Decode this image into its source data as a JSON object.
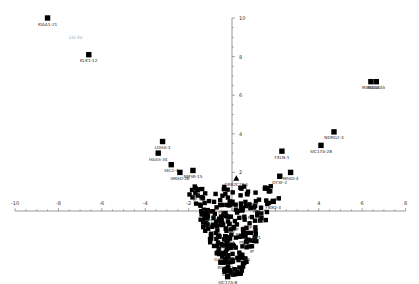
{
  "chart_data": {
    "type": "scatter",
    "title": "",
    "xlabel": "",
    "ylabel": "",
    "xlim": [
      -10,
      8
    ],
    "ylim": [
      -3.8,
      10
    ],
    "x_ticks": [
      -10,
      -8,
      -6,
      -4,
      -2,
      4,
      6,
      8
    ],
    "y_ticks": [
      2,
      4,
      6,
      8,
      10
    ],
    "grid": false,
    "legend": null,
    "annotation": {
      "text": "Lin Fo",
      "x": -7.5,
      "y": 8.9
    },
    "labeled_points": [
      {
        "label": "KIAA1-21",
        "x": -8.5,
        "y": 10.0,
        "marker": "square"
      },
      {
        "label": "KLK1-12",
        "x": -6.6,
        "y": 8.1,
        "marker": "square"
      },
      {
        "label": "LDHA-3",
        "x": -3.2,
        "y": 3.6,
        "marker": "square"
      },
      {
        "label": "HAAS-34",
        "x": -3.4,
        "y": 3.0,
        "marker": "square"
      },
      {
        "label": "SEL1-4",
        "x": -2.8,
        "y": 2.4,
        "marker": "square"
      },
      {
        "label": "SMAD-26",
        "x": -2.4,
        "y": 2.0,
        "marker": "square"
      },
      {
        "label": "NMSR-15",
        "x": -1.8,
        "y": 2.1,
        "marker": "square"
      },
      {
        "label": "GRB2C2P-1",
        "x": 0.2,
        "y": 1.7,
        "marker": "triangle"
      },
      {
        "label": "FXLN-1",
        "x": 2.3,
        "y": 3.1,
        "marker": "square"
      },
      {
        "label": "MFAD-4",
        "x": 2.7,
        "y": 2.0,
        "marker": "square"
      },
      {
        "label": "DYSF-2",
        "x": 2.2,
        "y": 1.8,
        "marker": "square"
      },
      {
        "label": "NDRG2-3",
        "x": 4.7,
        "y": 4.1,
        "marker": "square"
      },
      {
        "label": "SIC17A-28",
        "x": 4.1,
        "y": 3.4,
        "marker": "square"
      },
      {
        "label": "MAGEA4",
        "x": 6.4,
        "y": 6.7,
        "marker": "square"
      },
      {
        "label": "MAGEA5",
        "x": 6.65,
        "y": 6.7,
        "marker": "square"
      },
      {
        "label": "SEB-2",
        "x": -1.6,
        "y": 1.1,
        "marker": "square"
      },
      {
        "label": "PNLIP",
        "x": 0.6,
        "y": -1.3,
        "marker": "square"
      },
      {
        "label": "FBXO-3",
        "x": 1.9,
        "y": 0.5,
        "marker": "square"
      },
      {
        "label": "GALNT-2",
        "x": -0.4,
        "y": -2.2,
        "marker": "square"
      },
      {
        "label": "RGS-32",
        "x": -0.3,
        "y": -2.6,
        "marker": "square"
      },
      {
        "label": "SEMA",
        "x": -0.2,
        "y": -3.0,
        "marker": "square"
      },
      {
        "label": "SIC17A-8",
        "x": -0.2,
        "y": -3.4,
        "marker": "square"
      }
    ],
    "cluster": {
      "description": "Dense cluster of unlabeled/overlapping points near origin forming a V shape",
      "x_range": [
        -2,
        2.5
      ],
      "y_range": [
        -3.4,
        1.2
      ],
      "approx_count": 250
    }
  }
}
